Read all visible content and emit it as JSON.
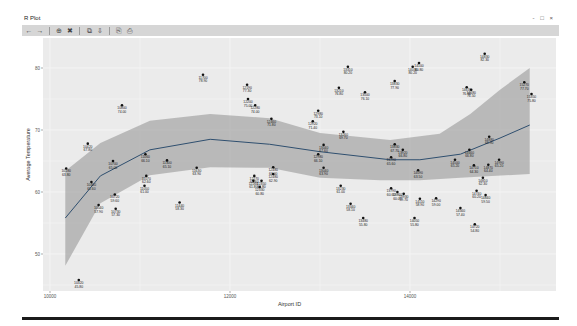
{
  "window": {
    "title": "R Plot",
    "controls": [
      "minimize",
      "restore",
      "close"
    ],
    "controls_text": "- □ ×"
  },
  "toolbar": {
    "buttons": [
      {
        "name": "back-button",
        "glyph": "←"
      },
      {
        "name": "forward-button",
        "glyph": "→"
      },
      {
        "sep": true
      },
      {
        "name": "zoom-button",
        "glyph": "⊕"
      },
      {
        "name": "clear-button",
        "glyph": "✖"
      },
      {
        "sep": true
      },
      {
        "name": "copy-button",
        "glyph": "⧉"
      },
      {
        "name": "export-button",
        "glyph": "⇩"
      },
      {
        "sep": true
      },
      {
        "name": "copy-metafile-button",
        "glyph": "⎘"
      },
      {
        "name": "save-button",
        "glyph": "⎙"
      }
    ]
  },
  "chart_data": {
    "type": "scatter",
    "title": "",
    "xlabel": "Airport ID",
    "ylabel": "Average Temperature",
    "xlim": [
      9950,
      15600
    ],
    "ylim": [
      44,
      83
    ],
    "x_ticks": [
      10000,
      12000,
      14000
    ],
    "x_tick_labels": [
      "10000",
      "12000",
      "14000"
    ],
    "y_ticks": [
      50,
      60,
      70,
      80
    ],
    "y_tick_labels": [
      "50",
      "60",
      "70",
      "80"
    ],
    "grid": true,
    "legend": "none",
    "point_labels": "two-line text labels (Airport ID / temperature) shown next to each point; illegible at this resolution",
    "points": [
      {
        "x": 10180,
        "y": 63.8
      },
      {
        "x": 10420,
        "y": 67.8
      },
      {
        "x": 10700,
        "y": 65.0
      },
      {
        "x": 11060,
        "y": 66.1
      },
      {
        "x": 11300,
        "y": 65.1
      },
      {
        "x": 10800,
        "y": 74.0
      },
      {
        "x": 10460,
        "y": 61.6
      },
      {
        "x": 10720,
        "y": 59.6
      },
      {
        "x": 11070,
        "y": 62.6
      },
      {
        "x": 11050,
        "y": 61.0
      },
      {
        "x": 11630,
        "y": 63.9
      },
      {
        "x": 10540,
        "y": 57.9
      },
      {
        "x": 10730,
        "y": 57.3
      },
      {
        "x": 11440,
        "y": 58.3
      },
      {
        "x": 10320,
        "y": 45.8
      },
      {
        "x": 12270,
        "y": 62.6
      },
      {
        "x": 12350,
        "y": 61.8
      },
      {
        "x": 12480,
        "y": 64.0
      },
      {
        "x": 12260,
        "y": 61.8
      },
      {
        "x": 12330,
        "y": 60.8
      },
      {
        "x": 12480,
        "y": 62.9
      },
      {
        "x": 14830,
        "y": 82.3
      },
      {
        "x": 13310,
        "y": 80.2
      },
      {
        "x": 14100,
        "y": 80.8
      },
      {
        "x": 14030,
        "y": 80.2
      },
      {
        "x": 13830,
        "y": 77.9
      },
      {
        "x": 13210,
        "y": 76.8
      },
      {
        "x": 13500,
        "y": 76.1
      },
      {
        "x": 14630,
        "y": 76.9
      },
      {
        "x": 14680,
        "y": 76.5
      },
      {
        "x": 15270,
        "y": 77.7
      },
      {
        "x": 15350,
        "y": 75.8
      },
      {
        "x": 12980,
        "y": 73.1
      },
      {
        "x": 13260,
        "y": 69.7
      },
      {
        "x": 14880,
        "y": 68.9
      },
      {
        "x": 13040,
        "y": 67.6
      },
      {
        "x": 12980,
        "y": 66.1
      },
      {
        "x": 13830,
        "y": 67.7
      },
      {
        "x": 13920,
        "y": 66.8
      },
      {
        "x": 13790,
        "y": 65.6
      },
      {
        "x": 14660,
        "y": 66.8
      },
      {
        "x": 14500,
        "y": 65.2
      },
      {
        "x": 13040,
        "y": 63.9
      },
      {
        "x": 14090,
        "y": 63.5
      },
      {
        "x": 14710,
        "y": 64.3
      },
      {
        "x": 14870,
        "y": 64.4
      },
      {
        "x": 14990,
        "y": 65.2
      },
      {
        "x": 14810,
        "y": 62.3
      },
      {
        "x": 13230,
        "y": 61.0
      },
      {
        "x": 13790,
        "y": 60.6
      },
      {
        "x": 13860,
        "y": 60.0
      },
      {
        "x": 13930,
        "y": 59.7
      },
      {
        "x": 14740,
        "y": 60.2
      },
      {
        "x": 14840,
        "y": 59.5
      },
      {
        "x": 14110,
        "y": 58.9
      },
      {
        "x": 14290,
        "y": 59.0
      },
      {
        "x": 13340,
        "y": 58.1
      },
      {
        "x": 14560,
        "y": 57.4
      },
      {
        "x": 13480,
        "y": 55.8
      },
      {
        "x": 14050,
        "y": 55.8
      },
      {
        "x": 14720,
        "y": 54.8
      },
      {
        "x": 11700,
        "y": 78.9
      },
      {
        "x": 12190,
        "y": 77.3
      },
      {
        "x": 12200,
        "y": 75.0
      },
      {
        "x": 12280,
        "y": 74.0
      },
      {
        "x": 12460,
        "y": 71.8
      },
      {
        "x": 12920,
        "y": 71.4
      }
    ],
    "smooth": {
      "method": "loess-like",
      "line_color": "#2f4f6f",
      "band_color": "#9e9e9e",
      "fit": [
        {
          "x": 10170,
          "y": 55.8
        },
        {
          "x": 10560,
          "y": 62.6
        },
        {
          "x": 11110,
          "y": 66.8
        },
        {
          "x": 11780,
          "y": 68.5
        },
        {
          "x": 12440,
          "y": 67.7
        },
        {
          "x": 13000,
          "y": 66.5
        },
        {
          "x": 13780,
          "y": 65.2
        },
        {
          "x": 14110,
          "y": 65.2
        },
        {
          "x": 14560,
          "y": 66.1
        },
        {
          "x": 15000,
          "y": 68.7
        },
        {
          "x": 15330,
          "y": 70.8
        }
      ],
      "upper": [
        {
          "x": 10170,
          "y": 63.4
        },
        {
          "x": 10560,
          "y": 67.9
        },
        {
          "x": 11110,
          "y": 71.5
        },
        {
          "x": 11780,
          "y": 72.6
        },
        {
          "x": 12440,
          "y": 71.9
        },
        {
          "x": 13000,
          "y": 69.5
        },
        {
          "x": 13780,
          "y": 68.4
        },
        {
          "x": 14330,
          "y": 69.4
        },
        {
          "x": 14670,
          "y": 72.6
        },
        {
          "x": 15000,
          "y": 76.5
        },
        {
          "x": 15330,
          "y": 80.0
        }
      ],
      "lower": [
        {
          "x": 10170,
          "y": 48.1
        },
        {
          "x": 10560,
          "y": 58.2
        },
        {
          "x": 11110,
          "y": 62.7
        },
        {
          "x": 11780,
          "y": 64.0
        },
        {
          "x": 12440,
          "y": 63.9
        },
        {
          "x": 13000,
          "y": 62.3
        },
        {
          "x": 13670,
          "y": 61.9
        },
        {
          "x": 14110,
          "y": 61.9
        },
        {
          "x": 14560,
          "y": 62.3
        },
        {
          "x": 15330,
          "y": 62.9
        }
      ]
    }
  }
}
